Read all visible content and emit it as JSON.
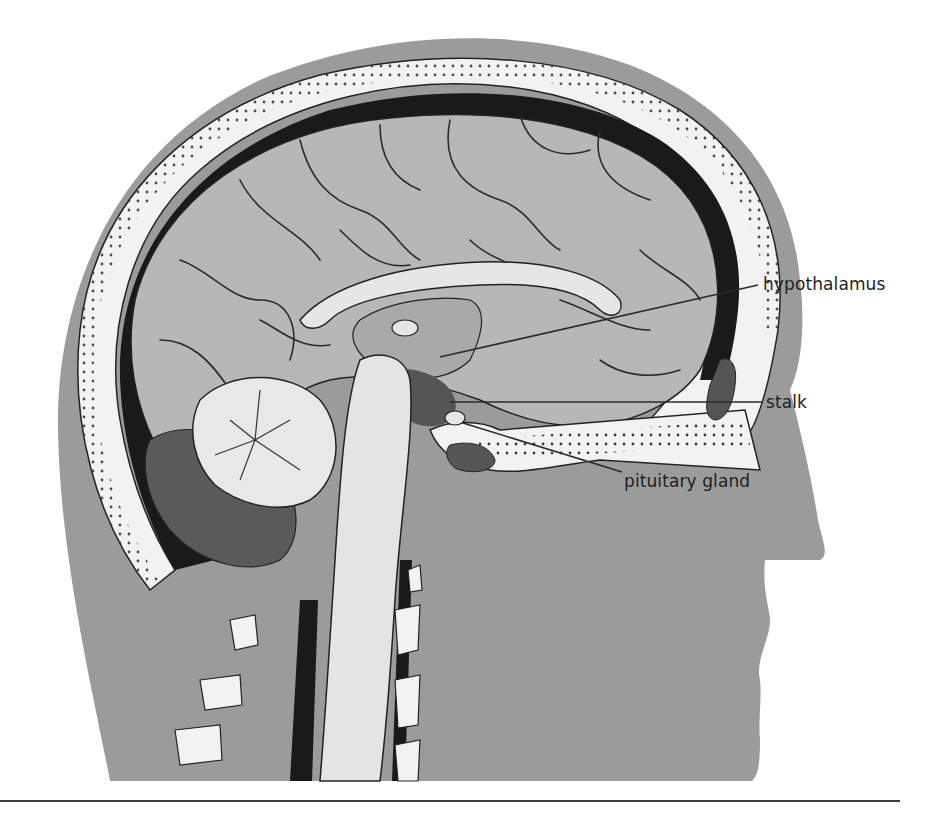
{
  "diagram": {
    "colors": {
      "skin": "#9b9b9b",
      "skull_bone": "#f2f2f2",
      "skull_dots": "#3a3a3a",
      "dura_dark": "#1a1a1a",
      "brain": "#b7b7b7",
      "sulci": "#2a2a2a",
      "corpus_callosum": "#e6e6e6",
      "brainstem": "#e4e4e4",
      "ventricle_dark": "#555555",
      "leader_line": "#2a2a2a",
      "rule": "#3a3a3a"
    },
    "labels": [
      {
        "id": "hypothalamus",
        "text": "hypothalamus",
        "x": 763,
        "y": 276,
        "line": {
          "x1": 440,
          "y1": 357,
          "x2": 758,
          "y2": 285
        }
      },
      {
        "id": "stalk",
        "text": "stalk",
        "x": 766,
        "y": 394,
        "line": {
          "x1": 450,
          "y1": 402,
          "x2": 762,
          "y2": 402
        }
      },
      {
        "id": "pituitary-gland",
        "text": "pituitary gland",
        "x": 624,
        "y": 473,
        "line": {
          "x1": 463,
          "y1": 423,
          "x2": 622,
          "y2": 472
        }
      }
    ]
  }
}
